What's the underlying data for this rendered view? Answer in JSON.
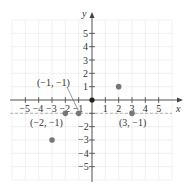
{
  "chart_data": {
    "type": "scatter",
    "title": "",
    "xlabel": "x",
    "ylabel": "y",
    "xlim": [
      -6,
      6
    ],
    "ylim": [
      -6,
      6
    ],
    "grid": true,
    "x_ticks": [
      "−5",
      "−4",
      "−3",
      "−2",
      "−1",
      "1",
      "2",
      "3",
      "4",
      "5"
    ],
    "y_ticks": [
      "5",
      "4",
      "3",
      "2",
      "1",
      "−1",
      "−2",
      "−3",
      "−4",
      "−5"
    ],
    "points": [
      {
        "x": 0,
        "y": 0
      },
      {
        "x": 2,
        "y": 1
      },
      {
        "x": -1,
        "y": -1
      },
      {
        "x": -2,
        "y": -1
      },
      {
        "x": 3,
        "y": -1
      },
      {
        "x": -3,
        "y": -3
      }
    ],
    "annotations": [
      {
        "text": "(−1, −1)",
        "point": [
          -1,
          -1
        ]
      },
      {
        "text": "(−2, −1)",
        "point": [
          -2,
          -1
        ]
      },
      {
        "text": "(3, −1)",
        "point": [
          3,
          -1
        ]
      }
    ],
    "reference_line": {
      "y": -1,
      "style": "dashed"
    }
  },
  "labels": {
    "x_axis": "x",
    "y_axis": "y",
    "ann_m1m1": "(−1, −1)",
    "ann_m2m1": "(−2, −1)",
    "ann_3m1": "(3, −1)",
    "xt": [
      "−5",
      "−4",
      "−3",
      "−2",
      "−1",
      "1",
      "2",
      "3",
      "4",
      "5"
    ],
    "yt": [
      "5",
      "4",
      "3",
      "2",
      "1",
      "−1",
      "−2",
      "−3",
      "−4",
      "−5"
    ]
  }
}
